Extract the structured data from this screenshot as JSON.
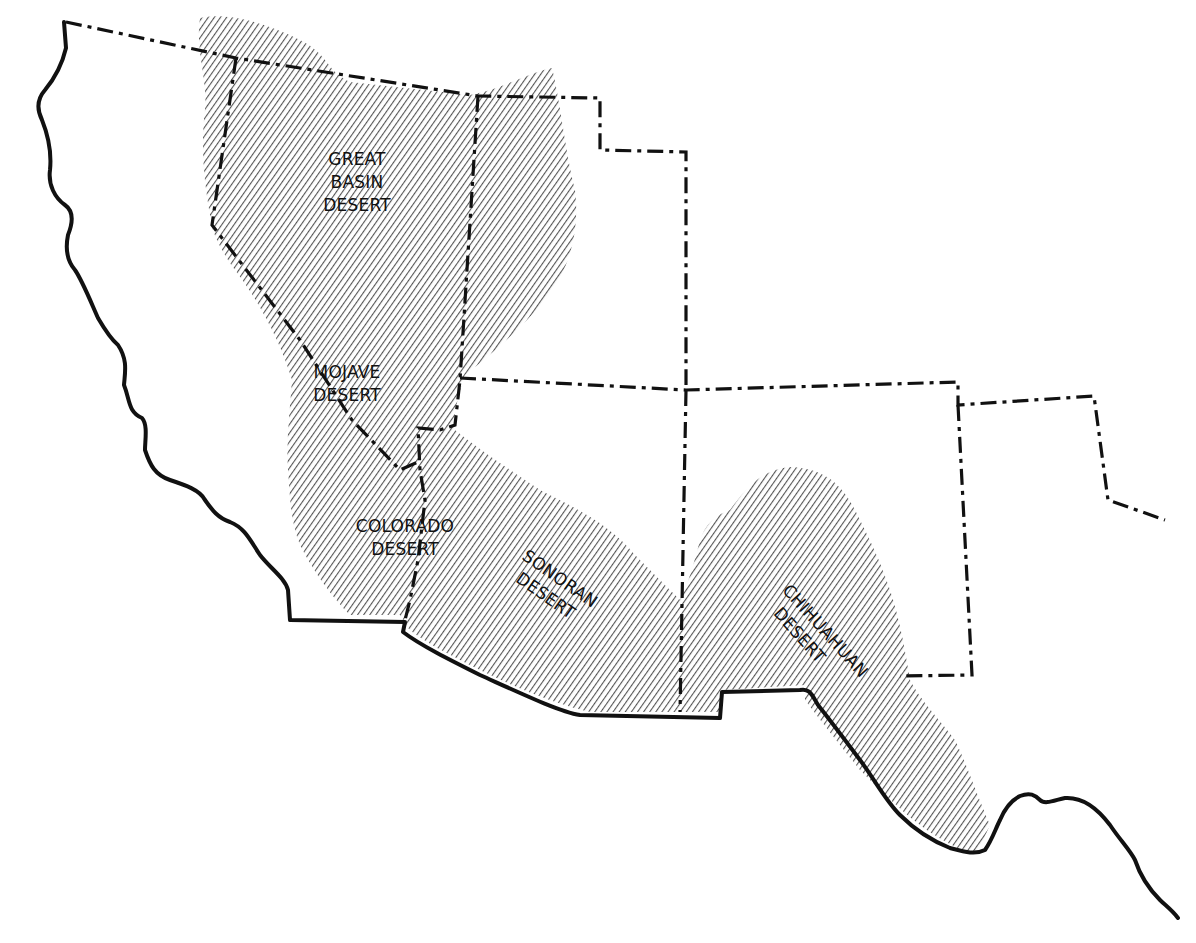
{
  "map": {
    "type": "regional thematic map",
    "region": "Southwestern North America",
    "style": {
      "background": "#ffffff",
      "ink": "#111111",
      "hatch_color": "#555555"
    },
    "deserts": [
      {
        "id": "great-basin",
        "line1": "GREAT",
        "line2": "BASIN",
        "line3": "DESERT"
      },
      {
        "id": "mojave",
        "line1": "MOJAVE",
        "line2": "DESERT"
      },
      {
        "id": "colorado",
        "line1": "COLORADO",
        "line2": "DESERT"
      },
      {
        "id": "sonoran",
        "line1": "SONORAN",
        "line2": "DESERT"
      },
      {
        "id": "chihuahuan",
        "line1": "CHIHUAHUAN",
        "line2": "DESERT"
      }
    ],
    "legend_styles": {
      "coastline": "solid heavy line",
      "international_border": "solid heavy line",
      "state_borders": "dash-dot line",
      "desert_area": "diagonal hatching"
    }
  }
}
